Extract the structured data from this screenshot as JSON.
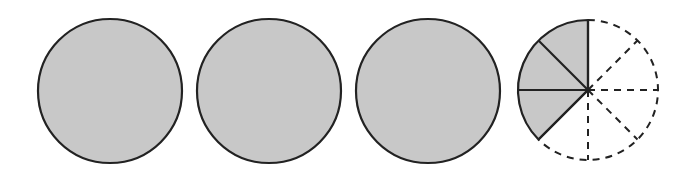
{
  "figure": {
    "fill_color": "#c8c8c8",
    "stroke_color": "#222222",
    "background": "#ffffff",
    "whole_circles": [
      {
        "cx": 110,
        "cy": 91,
        "r": 72,
        "shaded": true
      },
      {
        "cx": 269,
        "cy": 91,
        "r": 72,
        "shaded": true
      },
      {
        "cx": 428,
        "cy": 91,
        "r": 72,
        "shaded": true
      }
    ],
    "partial_circle": {
      "cx": 588,
      "cy": 90,
      "r": 70,
      "total_parts": 8,
      "shaded_parts": 3,
      "fraction_label": "3/8"
    },
    "represents": "3 3/8"
  }
}
